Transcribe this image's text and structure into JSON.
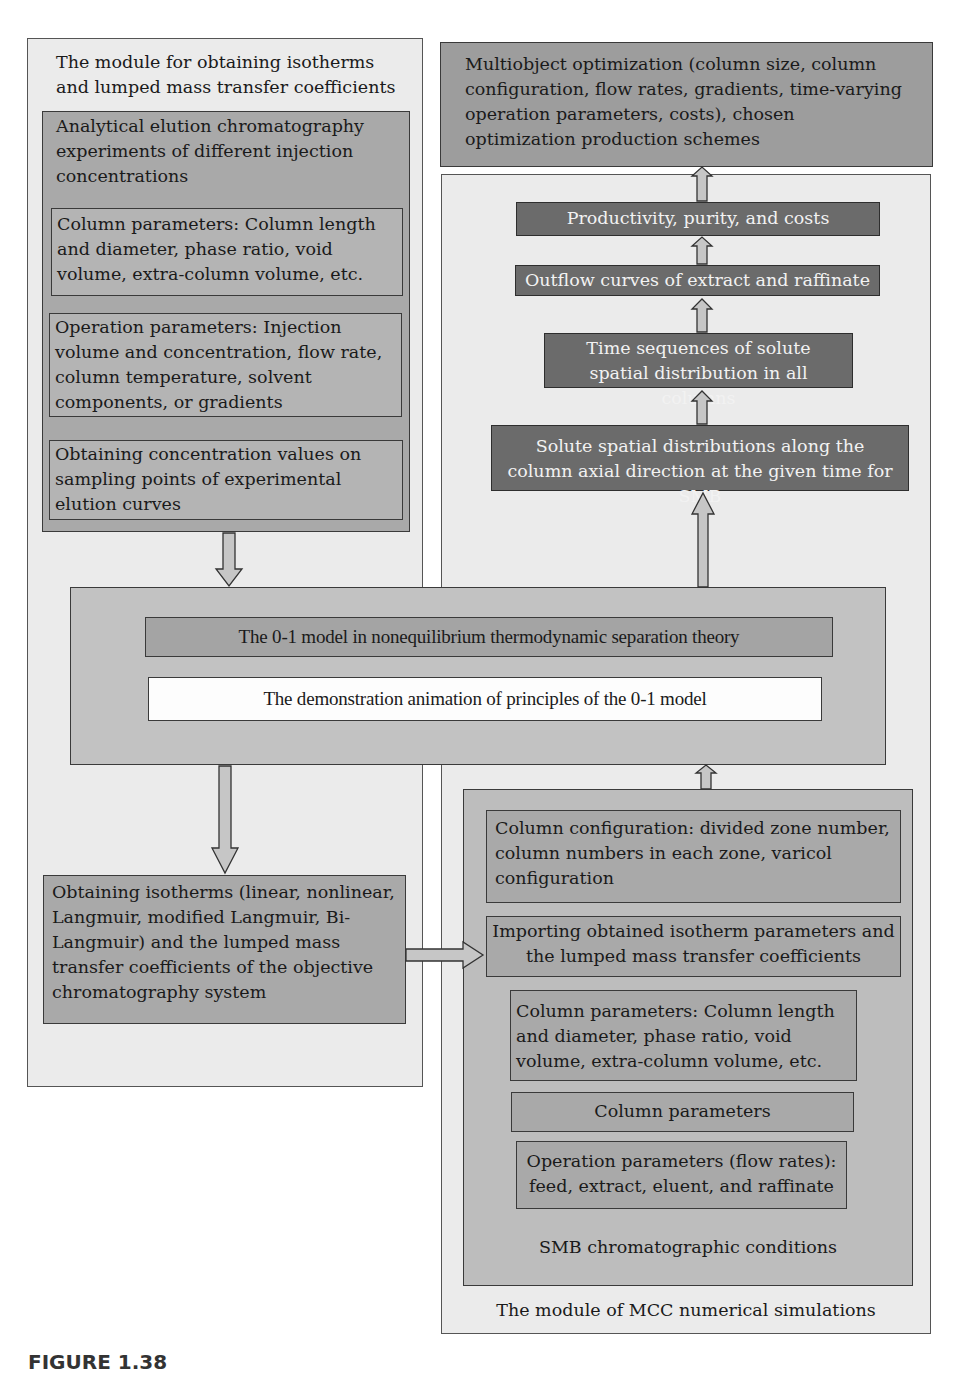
{
  "left_module": {
    "title": "The module for obtaining isotherms and lumped mass transfer coefficients",
    "experiments": {
      "title": "Analytical elution chromatography experiments of different injection concentrations",
      "column_params": "Column parameters: Column length and diameter, phase ratio, void volume, extra-column volume, etc.",
      "operation_params": "Operation parameters: Injection volume and concentration, flow rate, column temperature, solvent components, or gradients",
      "concentration_values": "Obtaining concentration values on sampling points of experimental elution curves"
    },
    "isotherms": "Obtaining isotherms (linear, nonlinear, Langmuir, modified Langmuir, Bi-Langmuir) and the lumped mass transfer coefficients of the objective chromatography system"
  },
  "optimization": "Multiobject optimization (column size, column configuration, flow rates, gradients, time-varying operation parameters, costs), chosen optimization production schemes",
  "right_module": {
    "title": "The module of MCC numerical simulations",
    "productivity": "Productivity, purity, and costs",
    "outflow": "Outflow curves of extract and raffinate",
    "time_sequences": "Time sequences of solute spatial distribution in all columns",
    "spatial_distributions": "Solute spatial distributions along the column axial direction at the given time for SMB",
    "smb": {
      "title": "SMB chromatographic conditions",
      "column_config": "Column configuration: divided zone number, column numbers in each zone, varicol configuration",
      "importing": "Importing obtained isotherm parameters and the lumped mass transfer coefficients",
      "column_params_detail": "Column parameters: Column length and diameter, phase ratio, void volume, extra-column volume, etc.",
      "column_params": "Column parameters",
      "operation_params": "Operation parameters (flow rates): feed, extract, eluent, and raffinate"
    }
  },
  "model": {
    "title": "The 0-1 model in nonequilibrium thermodynamic separation theory",
    "animation": "The demonstration animation of principles of the 0-1 model"
  },
  "caption": "FIGURE 1.38",
  "colors": {
    "panel": "#ebebeb",
    "mid": "#a9a9a9",
    "dark": "#6b6b6b",
    "arrow": "#c4c4c4"
  }
}
